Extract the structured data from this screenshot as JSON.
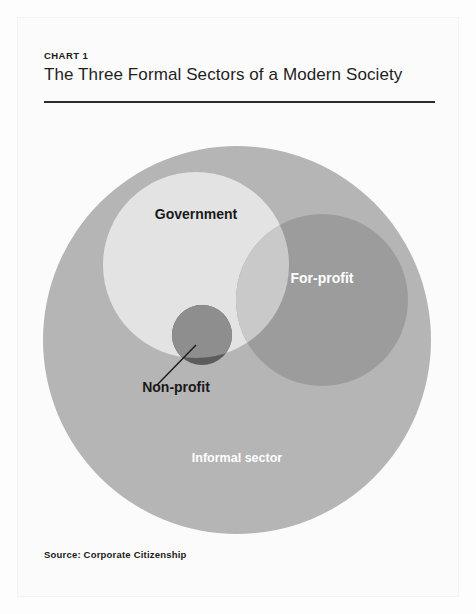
{
  "header": {
    "chart_label": "CHART 1",
    "title": "The Three Formal Sectors of a Modern Society"
  },
  "footer": {
    "source": "Source: Corporate Citizenship"
  },
  "chart_data": {
    "type": "venn",
    "title": "The Three Formal Sectors of a Modern Society",
    "subtitle": "CHART 1",
    "source": "Source: Corporate Citizenship",
    "legend_position": "in-figure",
    "sets": [
      {
        "name": "Informal sector",
        "label": "Informal sector",
        "color": "#b5b5b5",
        "label_color": "#ffffff",
        "cx": 237,
        "cy": 340,
        "r": 194,
        "label_x": 237,
        "label_y": 462,
        "role": "container"
      },
      {
        "name": "Government",
        "label": "Government",
        "color": "#e3e3e3",
        "label_color": "#1a1a1a",
        "cx": 196,
        "cy": 265,
        "r": 93,
        "label_x": 196,
        "label_y": 219,
        "role": "formal-sector"
      },
      {
        "name": "For-profit",
        "label": "For-profit",
        "color": "#9a9a9a",
        "label_color": "#ffffff",
        "cx": 322,
        "cy": 300,
        "r": 86,
        "label_x": 322,
        "label_y": 283,
        "role": "formal-sector"
      },
      {
        "name": "Non-profit",
        "label": "Non-profit",
        "color": "#5c5c5c",
        "label_color": "#1a1a1a",
        "cx": 202,
        "cy": 335,
        "r": 30,
        "label_x": 176,
        "label_y": 392,
        "role": "formal-sector",
        "has_leader_line": true,
        "leader_line": {
          "x1": 157,
          "y1": 385,
          "x2": 196,
          "y2": 345
        }
      }
    ],
    "overlaps": [
      {
        "between": [
          "Government",
          "For-profit"
        ],
        "color": "#c9c9c9"
      },
      {
        "between": [
          "Government",
          "Non-profit"
        ],
        "color": "#8e8e8e"
      },
      {
        "between": [
          "For-profit",
          "Non-profit"
        ],
        "color": "#4a4a4a"
      }
    ]
  }
}
